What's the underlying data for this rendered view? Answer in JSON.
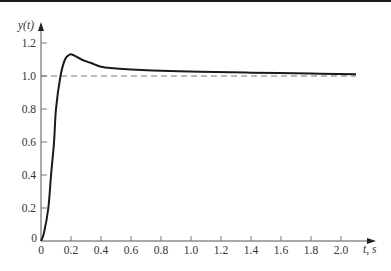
{
  "chart_data": {
    "type": "line",
    "title": "",
    "xlabel": "t, s",
    "ylabel": "y(t)",
    "xlim": [
      0,
      2.2
    ],
    "ylim": [
      0,
      1.3
    ],
    "grid": false,
    "legend": null,
    "x_ticks": [
      "0",
      "0.2",
      "0.4",
      "0.6",
      "0.8",
      "1.0",
      "1.2",
      "1.4",
      "1.6",
      "1.8",
      "2.0"
    ],
    "y_ticks": [
      "0",
      "0.2",
      "0.4",
      "0.6",
      "0.8",
      "1.0",
      "1.2"
    ],
    "series": [
      {
        "name": "y(t)",
        "style": "solid",
        "color": "#1a1a1a",
        "x": [
          0,
          0.02,
          0.049,
          0.067,
          0.087,
          0.1,
          0.13,
          0.16,
          0.19,
          0.22,
          0.27,
          0.33,
          0.4,
          0.49,
          0.6,
          0.86,
          1.06,
          1.4,
          1.8,
          2.1
        ],
        "y": [
          0,
          0.05,
          0.2,
          0.4,
          0.6,
          0.8,
          1.0,
          1.1,
          1.13,
          1.125,
          1.1,
          1.08,
          1.056,
          1.047,
          1.04,
          1.03,
          1.026,
          1.02,
          1.015,
          1.01
        ]
      },
      {
        "name": "reference",
        "style": "dashed",
        "color": "#777777",
        "x": [
          0,
          2.1
        ],
        "y": [
          1.0,
          1.0
        ]
      }
    ],
    "annotations": []
  },
  "axes": {
    "x_label": "t, s",
    "y_label": "y(t)"
  }
}
